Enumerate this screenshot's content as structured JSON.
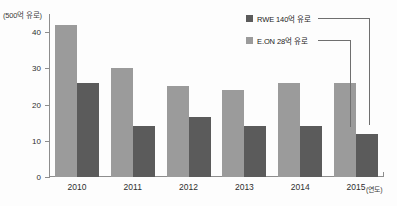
{
  "chart_data": {
    "type": "bar",
    "title": "",
    "subtitle": "",
    "categories": [
      "2010",
      "2011",
      "2012",
      "2013",
      "2014",
      "2015"
    ],
    "series": [
      {
        "name": "RWE 140억 유로",
        "color": "#9b9b9b",
        "values": [
          42,
          30,
          25,
          24,
          26,
          26
        ]
      },
      {
        "name": "E.ON 28억 유로",
        "color": "#5b5b5b",
        "values": [
          26,
          14,
          16.5,
          14,
          14,
          12
        ]
      }
    ],
    "xlabel": "(연도)",
    "ylabel": "(500억 유로)",
    "ylim": [
      0,
      45
    ],
    "yticks": [
      0,
      10,
      20,
      30,
      40
    ],
    "ytick_labels": [
      "0",
      "10",
      "20",
      "30",
      "40"
    ],
    "grid": false,
    "legend_position": "top-right"
  },
  "axes": {
    "y_unit_caption": "(500억 유로)",
    "x_unit_caption": "(연도)"
  },
  "legend": {
    "items": [
      {
        "label": "RWE 140억 유로",
        "swatch": "#5b5b5b"
      },
      {
        "label": "E.ON 28억 유로",
        "swatch": "#9b9b9b"
      }
    ]
  },
  "colors": {
    "series_light": "#9b9b9b",
    "series_dark": "#5b5b5b",
    "axis": "#8d8d8d",
    "text": "#2e2e2e",
    "background": "#fdfdfd"
  }
}
